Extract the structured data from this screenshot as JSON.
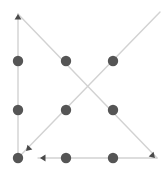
{
  "diagram": {
    "canvas": {
      "width": 168,
      "height": 172,
      "background": "#ffffff"
    },
    "style": {
      "edge_color": "#d2d2d2",
      "edge_width": 1.4,
      "node_color": "#555555",
      "node_radius": 5.2,
      "arrow_color": "#4a4a4a",
      "arrow_size": 5.5
    },
    "nodes": [
      {
        "id": "n-top-left",
        "label": "",
        "x": 18,
        "y": 61
      },
      {
        "id": "n-top-center",
        "label": "",
        "x": 66,
        "y": 61
      },
      {
        "id": "n-top-right",
        "label": "",
        "x": 113,
        "y": 61
      },
      {
        "id": "n-middle-left",
        "label": "",
        "x": 18,
        "y": 110
      },
      {
        "id": "n-middle-center",
        "label": "",
        "x": 66,
        "y": 110
      },
      {
        "id": "n-middle-right",
        "label": "",
        "x": 113,
        "y": 110
      },
      {
        "id": "n-bottom-left",
        "label": "",
        "x": 18,
        "y": 158
      },
      {
        "id": "n-bottom-center",
        "label": "",
        "x": 66,
        "y": 158
      },
      {
        "id": "n-bottom-right",
        "label": "",
        "x": 113,
        "y": 158
      }
    ],
    "edges": [
      {
        "id": "edge-left-column",
        "x1": 18,
        "y1": 158,
        "x2": 18,
        "y2": 14
      },
      {
        "id": "edge-diagonal-falling",
        "x1": 18,
        "y1": 14,
        "x2": 157,
        "y2": 158
      },
      {
        "id": "edge-diagonal-rising",
        "x1": 18,
        "y1": 158,
        "x2": 160,
        "y2": 12
      },
      {
        "id": "edge-bottom-row",
        "x1": 157,
        "y1": 158,
        "x2": 38,
        "y2": 158
      }
    ],
    "arrowheads": [
      {
        "id": "arrow-up-top-left",
        "x": 18,
        "y": 14,
        "direction": "up",
        "angle": -90
      },
      {
        "id": "arrow-into-bottom-left",
        "x": 26,
        "y": 151,
        "direction": "down-left",
        "angle": 135
      },
      {
        "id": "arrow-left-bottom-row",
        "x": 40,
        "y": 158,
        "direction": "left",
        "angle": 180
      },
      {
        "id": "arrow-bottom-right",
        "x": 155,
        "y": 158,
        "direction": "down-right",
        "angle": 45
      }
    ]
  }
}
